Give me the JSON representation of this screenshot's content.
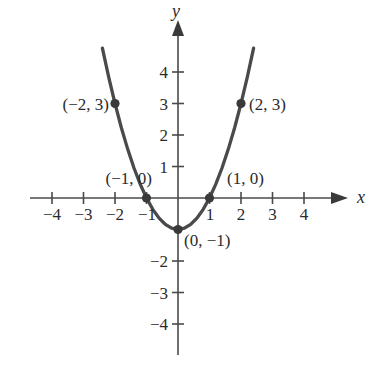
{
  "chart_data": {
    "type": "line",
    "title": "",
    "subtitle": "",
    "xlabel": "x",
    "ylabel": "y",
    "function_label": "y = x^2 - 1",
    "grid": false,
    "legend_position": "none",
    "xlim": [
      -4.7,
      4.7
    ],
    "ylim": [
      -4.8,
      5.3
    ],
    "x_ticks": [
      -4,
      -3,
      -2,
      -1,
      1,
      2,
      3,
      4
    ],
    "x_tick_labels": [
      "−4",
      "−3",
      "−2",
      "−1",
      "1",
      "2",
      "3",
      "4"
    ],
    "y_ticks": [
      4,
      3,
      2,
      1,
      -2,
      -3,
      -4
    ],
    "y_tick_labels": [
      "4",
      "3",
      "2",
      "1",
      "−2",
      "−3",
      "−4"
    ],
    "x": [
      -2.4,
      -2.2,
      -2.0,
      -1.8,
      -1.6,
      -1.4,
      -1.2,
      -1.0,
      -0.8,
      -0.6,
      -0.4,
      -0.2,
      0.0,
      0.2,
      0.4,
      0.6,
      0.8,
      1.0,
      1.2,
      1.4,
      1.6,
      1.8,
      2.0,
      2.2,
      2.4
    ],
    "y": [
      4.76,
      3.84,
      3.0,
      2.24,
      1.56,
      0.96,
      0.44,
      0.0,
      -0.36,
      -0.64,
      -0.84,
      -0.96,
      -1.0,
      -0.96,
      -0.84,
      -0.64,
      -0.36,
      0.0,
      0.44,
      0.96,
      1.56,
      2.24,
      3.0,
      3.84,
      4.76
    ],
    "series": [
      {
        "name": "y = x^2 - 1",
        "x": [
          -2.4,
          -2.2,
          -2.0,
          -1.8,
          -1.6,
          -1.4,
          -1.2,
          -1.0,
          -0.8,
          -0.6,
          -0.4,
          -0.2,
          0.0,
          0.2,
          0.4,
          0.6,
          0.8,
          1.0,
          1.2,
          1.4,
          1.6,
          1.8,
          2.0,
          2.2,
          2.4
        ],
        "y": [
          4.76,
          3.84,
          3.0,
          2.24,
          1.56,
          0.96,
          0.44,
          0.0,
          -0.36,
          -0.64,
          -0.84,
          -0.96,
          -1.0,
          -0.96,
          -0.84,
          -0.64,
          -0.36,
          0.0,
          0.44,
          0.96,
          1.56,
          2.24,
          3.0,
          3.84,
          4.76
        ]
      }
    ],
    "marked_points": [
      {
        "x": -2,
        "y": 3,
        "label": "(−2, 3)",
        "label_side": "left"
      },
      {
        "x": -1,
        "y": 0,
        "label": "(−1, 0)",
        "label_side": "above-left"
      },
      {
        "x": 0,
        "y": -1,
        "label": "(0, −1)",
        "label_side": "below-right"
      },
      {
        "x": 1,
        "y": 0,
        "label": "(1, 0)",
        "label_side": "above-right"
      },
      {
        "x": 2,
        "y": 3,
        "label": "(2, 3)",
        "label_side": "right"
      }
    ],
    "annotations": [
      "(−2, 3)",
      "(−1, 0)",
      "(0, −1)",
      "(1, 0)",
      "(2, 3)"
    ],
    "colors": {
      "curve": "#4a4a4a",
      "axis": "#4a4a4a",
      "marker": "#3a3a3a",
      "text": "#2b2b2b",
      "background": "#ffffff"
    }
  },
  "axes": {
    "x_label": "x",
    "y_label": "y"
  },
  "x_tick_labels": {
    "n4": "−4",
    "n3": "−3",
    "n2": "−2",
    "n1": "−1",
    "p1": "1",
    "p2": "2",
    "p3": "3",
    "p4": "4"
  },
  "y_tick_labels": {
    "p4": "4",
    "p3": "3",
    "p2": "2",
    "p1": "1",
    "n2": "−2",
    "n3": "−3",
    "n4": "−4"
  },
  "point_labels": {
    "neg2_3": "(−2, 3)",
    "neg1_0": "(−1, 0)",
    "zero_neg1": "(0, −1)",
    "pos1_0": "(1, 0)",
    "pos2_3": "(2, 3)"
  }
}
